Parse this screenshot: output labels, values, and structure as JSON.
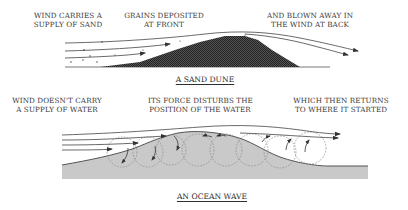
{
  "sand_dune": {
    "title": "A SAND DUNE",
    "labels": [
      {
        "line1": "WIND CARRIES A",
        "line2": "SUPPLY OF SAND"
      },
      {
        "line1": "GRAINS DEPOSITED",
        "line2": "AT FRONT"
      },
      {
        "line1": "AND BLOWN AWAY IN",
        "line2": "THE WIND AT BACK"
      }
    ],
    "fill_color": "#3c3c3c"
  },
  "ocean_wave": {
    "title": "AN OCEAN WAVE",
    "labels": [
      {
        "line1": "WIND DOESN'T CARRY",
        "line2": "A SUPPLY OF WATER"
      },
      {
        "line1": "ITS FORCE DISTURBS THE",
        "line2": "POSITION OF THE WATER"
      },
      {
        "line1": "WHICH THEN RETURNS",
        "line2": "TO WHERE IT STARTED"
      }
    ],
    "fill_color": "#c8c8c8"
  }
}
